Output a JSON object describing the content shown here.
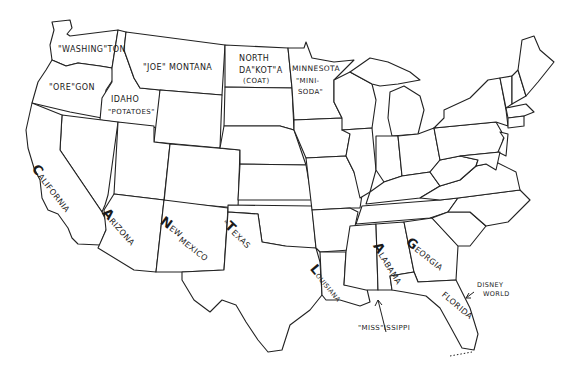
{
  "map": {
    "title": "Pun map of the United States",
    "labels": {
      "washington": "\"WASHING\"TON",
      "oregon": "\"ORE\"GON",
      "idaho_line1": "IDAHO",
      "idaho_line2": "\"POTATOES\"",
      "montana": "\"JOE\" MONTANA",
      "north_dakota_line1": "NORTH",
      "north_dakota_line2": "DA\"KOT\"A",
      "north_dakota_line3": "(COAT)",
      "minnesota_line1": "MINNESOTA",
      "minnesota_line2": "\"MINI-",
      "minnesota_line3": "SODA\"",
      "california_cap": "C",
      "california_rest": "ALIFORNIA",
      "arizona_cap": "A",
      "arizona_rest": "RIZONA",
      "new_mexico_cap": "N",
      "new_mexico_rest1": "EW",
      "new_mexico_rest2": "MEXICO",
      "texas_prefix": "\"",
      "texas_cap": "T",
      "texas_rest": "EXAS",
      "louisiana_cap": "L",
      "louisiana_rest": "OUISIANA",
      "alabama_cap": "A",
      "alabama_rest": "LABAMA",
      "georgia_cap": "G",
      "georgia_rest": "EORGIA",
      "florida": "FLORIDA",
      "disney_line1": "DISNEY",
      "disney_line2": "WORLD",
      "mississippi": "\"MISS\"ISSIPPI"
    },
    "colors": {
      "ink": "#222222",
      "background": "#ffffff"
    }
  }
}
